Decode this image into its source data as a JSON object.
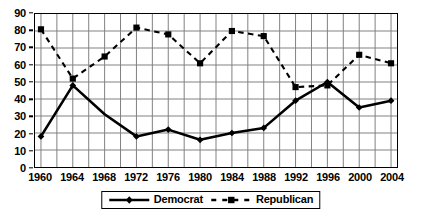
{
  "chart_data": {
    "type": "line",
    "title": "",
    "subtitle": "",
    "xlabel": "",
    "ylabel": "",
    "categories": [
      "1960",
      "1964",
      "1968",
      "1972",
      "1976",
      "1980",
      "1984",
      "1988",
      "1992",
      "1996",
      "2000",
      "2004"
    ],
    "x": [
      1960,
      1964,
      1968,
      1972,
      1976,
      1980,
      1984,
      1988,
      1992,
      1996,
      2000,
      2004
    ],
    "series": [
      {
        "name": "Democrat",
        "values": [
          18,
          48,
          31,
          18,
          22,
          16,
          20,
          23,
          39,
          50,
          35,
          39
        ],
        "line_style": "solid",
        "marker": "diamond",
        "color": "#000000",
        "markers_at": [
          1960,
          1964,
          1972,
          1976,
          1980,
          1984,
          1988,
          1992,
          1996,
          2000,
          2004
        ]
      },
      {
        "name": "Republican",
        "values": [
          81,
          52,
          65,
          82,
          78,
          61,
          80,
          77,
          47,
          48,
          66,
          61
        ],
        "line_style": "dashed",
        "marker": "square",
        "color": "#000000",
        "markers_at": [
          1960,
          1964,
          1968,
          1972,
          1976,
          1980,
          1984,
          1988,
          1992,
          1996,
          2000,
          2004
        ]
      }
    ],
    "ylim": [
      0,
      90
    ],
    "ytick_step": 10,
    "yticks": [
      0,
      10,
      20,
      30,
      40,
      50,
      60,
      70,
      80,
      90
    ],
    "ytick_labels": [
      "0",
      "10",
      "20",
      "30",
      "40",
      "50",
      "60",
      "70",
      "80",
      "90"
    ],
    "xtick_labels": [
      "1960",
      "1964",
      "1968",
      "1972",
      "1976",
      "1980",
      "1984",
      "1988",
      "1992",
      "1996",
      "2000",
      "2004"
    ],
    "grid": true,
    "grid_axes": "both",
    "grid_color": "#808080",
    "legend_position": "bottom-center",
    "legend_entries": [
      "Democrat",
      "Republican"
    ],
    "plot_bgcolor": "#ffffff",
    "border_color": "#000000"
  }
}
